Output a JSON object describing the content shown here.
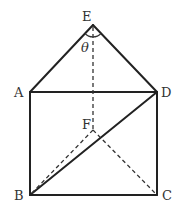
{
  "diagram": {
    "type": "geometry-figure",
    "points": {
      "E": {
        "label": "E",
        "x": 93,
        "y": 25
      },
      "A": {
        "label": "A",
        "x": 30,
        "y": 92
      },
      "D": {
        "label": "D",
        "x": 157,
        "y": 92
      },
      "F": {
        "label": "F",
        "x": 93,
        "y": 130
      },
      "B": {
        "label": "B",
        "x": 30,
        "y": 195
      },
      "C": {
        "label": "C",
        "x": 157,
        "y": 195
      }
    },
    "solid_edges": [
      "EA",
      "ED",
      "AD",
      "AB",
      "DC",
      "BC",
      "BD"
    ],
    "dashed_edges": [
      "EF",
      "FB",
      "FC"
    ],
    "angle": {
      "vertex": "E",
      "label": "θ",
      "between": [
        "EA",
        "ED"
      ]
    },
    "stroke_color": "#222222"
  }
}
